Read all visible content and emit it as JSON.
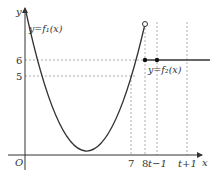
{
  "diagram": {
    "axes": {
      "x_label": "x",
      "y_label": "y",
      "origin_label": "O"
    },
    "x_ticks": [
      "7",
      "8",
      "t−1",
      "t+1"
    ],
    "y_ticks": [
      "6",
      "5"
    ],
    "curves": [
      {
        "name": "f1",
        "label": "y=f₁(x)",
        "description": "parabola opening upward, defined up to x=8 with open endpoint"
      },
      {
        "name": "f2",
        "label": "y=f₂(x)",
        "description": "horizontal line y=6 starting at x=8 (closed)"
      }
    ],
    "points": [
      {
        "x": "8",
        "y": "open",
        "type": "open-circle"
      },
      {
        "x": "8",
        "y": "6",
        "type": "filled-dot"
      },
      {
        "x": "t−1",
        "y": "6",
        "type": "filled-dot"
      }
    ],
    "colors": {
      "curve": "#333333",
      "dashed": "#888888",
      "axis": "#333333"
    }
  }
}
